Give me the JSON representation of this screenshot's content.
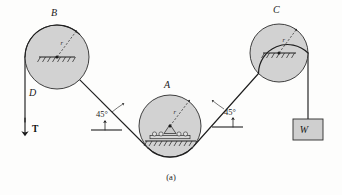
{
  "figure": {
    "caption": "(a)",
    "background_color": "#fdfdfc",
    "pulley_fill_color": "#d2d2d2",
    "line_color": "#1f1f1f"
  },
  "pulleys": [
    {
      "id": "B",
      "label": "B",
      "radius_label": "r",
      "support_type": "fixed-hatched",
      "cx": 57,
      "cy": 57,
      "r": 32
    },
    {
      "id": "A",
      "label": "A",
      "radius_label": "r",
      "support_type": "roller-hatched",
      "cx": 170,
      "cy": 126,
      "r": 31
    },
    {
      "id": "C",
      "label": "C",
      "radius_label": "r",
      "support_type": "fixed-hatched",
      "cx": 279,
      "cy": 53,
      "r": 29
    }
  ],
  "forces": [
    {
      "id": "D",
      "label": "D",
      "symbol_label": "T",
      "direction": "down",
      "description": "tension force applied downward on left cable"
    },
    {
      "id": "W",
      "label": "W",
      "description": "hanging weight block on right cable"
    }
  ],
  "angles": [
    {
      "id": "angle-left",
      "value": "45°",
      "reference": "horizontal"
    },
    {
      "id": "angle-right",
      "value": "45°",
      "reference": "horizontal"
    }
  ],
  "labels": {
    "pulley_b": "B",
    "pulley_a": "A",
    "pulley_c": "C",
    "cable_d": "D",
    "tension_t": "T",
    "weight_w": "W",
    "radius_b": "r",
    "radius_a": "r",
    "radius_c": "r",
    "angle_left": "45°",
    "angle_right": "45°",
    "caption": "(a)"
  }
}
